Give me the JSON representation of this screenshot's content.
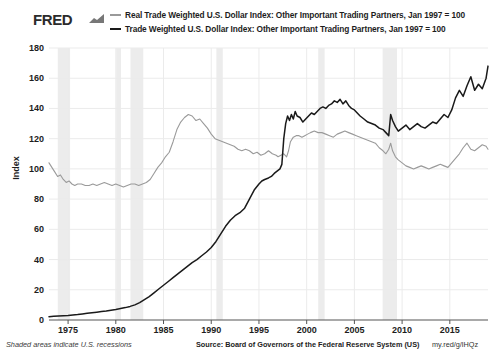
{
  "header": {
    "brand": "FRED",
    "brand_mark_icon": "fred-sparkline-icon"
  },
  "legend": {
    "position": "top",
    "items": [
      {
        "label": "Real Trade Weighted U.S. Dollar Index: Other Important Trading Partners, Jan 1997 = 100",
        "color": "#9a9a9a"
      },
      {
        "label": "Trade Weighted U.S. Dollar Index: Other Important Trading Partners, Jan 1997 = 100",
        "color": "#1a1a1a"
      }
    ]
  },
  "footer": {
    "note": "Shaded areas indicate U.S. recessions",
    "source": "Source: Board of Governors of the Federal Reserve System (US)",
    "url": "my.red/g/lHQz"
  },
  "chart_data": {
    "type": "line",
    "title": "",
    "xlabel": "",
    "ylabel": "Index",
    "xlim": [
      1973.0,
      2019.0
    ],
    "ylim": [
      0,
      180
    ],
    "yticks": [
      0,
      20,
      40,
      60,
      80,
      100,
      120,
      140,
      160,
      180
    ],
    "xticks": [
      1975,
      1980,
      1985,
      1990,
      1995,
      2000,
      2005,
      2010,
      2015
    ],
    "grid": true,
    "grid_color": "#ebebeb",
    "recession_color": "#ececec",
    "recessions": [
      {
        "start": 1973.92,
        "end": 1975.21
      },
      {
        "start": 1980.04,
        "end": 1980.54
      },
      {
        "start": 1981.54,
        "end": 1982.88
      },
      {
        "start": 1990.54,
        "end": 1991.21
      },
      {
        "start": 2001.21,
        "end": 2001.88
      },
      {
        "start": 2007.96,
        "end": 2009.46
      }
    ],
    "series": [
      {
        "name": "Real Trade Weighted U.S. Dollar Index: Other Important Trading Partners, Jan 1997 = 100",
        "color": "#9a9a9a",
        "width": 1.1,
        "x": [
          1973.0,
          1973.3,
          1973.6,
          1973.9,
          1974.2,
          1974.5,
          1974.8,
          1975.1,
          1975.4,
          1975.7,
          1976.0,
          1976.4,
          1976.8,
          1977.2,
          1977.6,
          1978.0,
          1978.4,
          1978.8,
          1979.2,
          1979.6,
          1980.0,
          1980.4,
          1980.8,
          1981.2,
          1981.6,
          1982.0,
          1982.4,
          1982.8,
          1983.2,
          1983.6,
          1984.0,
          1984.4,
          1984.8,
          1985.2,
          1985.6,
          1986.0,
          1986.4,
          1986.8,
          1987.2,
          1987.6,
          1988.0,
          1988.4,
          1988.8,
          1989.2,
          1989.6,
          1990.0,
          1990.4,
          1990.8,
          1991.2,
          1991.6,
          1992.0,
          1992.4,
          1992.8,
          1993.2,
          1993.6,
          1994.0,
          1994.4,
          1994.8,
          1995.2,
          1995.6,
          1996.0,
          1996.4,
          1996.8,
          1997.0,
          1997.3,
          1997.6,
          1997.9,
          1998.1,
          1998.3,
          1998.6,
          1998.9,
          1999.2,
          1999.5,
          1999.8,
          2000.1,
          2000.4,
          2000.8,
          2001.2,
          2001.6,
          2002.0,
          2002.4,
          2002.8,
          2003.2,
          2003.6,
          2004.0,
          2004.4,
          2004.8,
          2005.2,
          2005.6,
          2006.0,
          2006.4,
          2006.8,
          2007.2,
          2007.6,
          2008.0,
          2008.3,
          2008.6,
          2008.8,
          2009.0,
          2009.3,
          2009.6,
          2010.0,
          2010.4,
          2010.8,
          2011.2,
          2011.6,
          2012.0,
          2012.4,
          2012.8,
          2013.2,
          2013.6,
          2014.0,
          2014.4,
          2014.8,
          2015.2,
          2015.6,
          2016.0,
          2016.4,
          2016.8,
          2017.2,
          2017.6,
          2018.0,
          2018.4,
          2018.8,
          2019.0
        ],
        "y": [
          104,
          101,
          98,
          95,
          96,
          93,
          91,
          92,
          90,
          89,
          90,
          90,
          89,
          89,
          90,
          89,
          90,
          91,
          90,
          89,
          90,
          89,
          88,
          89,
          90,
          90,
          89,
          90,
          91,
          93,
          97,
          101,
          104,
          108,
          111,
          118,
          126,
          131,
          134,
          136,
          135,
          132,
          133,
          130,
          127,
          123,
          120,
          119,
          118,
          117,
          116,
          115,
          113,
          112,
          113,
          112,
          110,
          111,
          109,
          110,
          112,
          110,
          109,
          108,
          109,
          110,
          108,
          112,
          118,
          121,
          122,
          122,
          121,
          122,
          123,
          124,
          125,
          124,
          124,
          123,
          122,
          121,
          123,
          124,
          125,
          124,
          123,
          122,
          121,
          120,
          119,
          118,
          117,
          114,
          112,
          110,
          113,
          117,
          112,
          108,
          106,
          104,
          102,
          101,
          100,
          101,
          102,
          101,
          100,
          101,
          102,
          103,
          102,
          101,
          104,
          107,
          110,
          114,
          117,
          113,
          112,
          114,
          116,
          115,
          113
        ]
      },
      {
        "name": "Trade Weighted U.S. Dollar Index: Other Important Trading Partners, Jan 1997 = 100",
        "color": "#1a1a1a",
        "width": 1.5,
        "x": [
          1973.0,
          1973.5,
          1974.0,
          1974.5,
          1975.0,
          1975.5,
          1976.0,
          1976.5,
          1977.0,
          1977.5,
          1978.0,
          1978.5,
          1979.0,
          1979.5,
          1980.0,
          1980.5,
          1981.0,
          1981.5,
          1982.0,
          1982.5,
          1983.0,
          1983.5,
          1984.0,
          1984.5,
          1985.0,
          1985.5,
          1986.0,
          1986.5,
          1987.0,
          1987.5,
          1988.0,
          1988.5,
          1989.0,
          1989.5,
          1990.0,
          1990.5,
          1991.0,
          1991.5,
          1992.0,
          1992.5,
          1993.0,
          1993.5,
          1994.0,
          1994.5,
          1995.0,
          1995.3,
          1995.6,
          1996.0,
          1996.3,
          1996.6,
          1997.0,
          1997.2,
          1997.4,
          1997.6,
          1997.8,
          1998.0,
          1998.2,
          1998.4,
          1998.6,
          1998.8,
          1999.0,
          1999.3,
          1999.6,
          1999.9,
          2000.2,
          2000.5,
          2000.8,
          2001.1,
          2001.4,
          2001.7,
          2002.0,
          2002.3,
          2002.6,
          2002.9,
          2003.2,
          2003.5,
          2003.8,
          2004.1,
          2004.4,
          2004.7,
          2005.0,
          2005.3,
          2005.6,
          2006.0,
          2006.4,
          2006.8,
          2007.2,
          2007.6,
          2008.0,
          2008.3,
          2008.6,
          2008.8,
          2009.0,
          2009.3,
          2009.6,
          2010.0,
          2010.4,
          2010.8,
          2011.2,
          2011.6,
          2012.0,
          2012.4,
          2012.8,
          2013.2,
          2013.6,
          2014.0,
          2014.4,
          2014.8,
          2015.2,
          2015.6,
          2016.0,
          2016.4,
          2016.8,
          2017.2,
          2017.6,
          2018.0,
          2018.4,
          2018.8,
          2019.0
        ],
        "y": [
          2.2,
          2.4,
          2.6,
          2.8,
          3.0,
          3.3,
          3.6,
          4.0,
          4.4,
          4.8,
          5.2,
          5.6,
          6.0,
          6.5,
          7.0,
          7.6,
          8.2,
          9.0,
          10.0,
          11.5,
          13.5,
          15.5,
          18.0,
          20.5,
          23.0,
          25.5,
          28.0,
          30.5,
          33.0,
          35.5,
          38.0,
          40.0,
          42.5,
          45.0,
          48.0,
          52.0,
          57.0,
          62.0,
          66.0,
          69.0,
          71.0,
          74.0,
          80.0,
          86.0,
          90.0,
          92.0,
          93.0,
          94.0,
          95.0,
          97.0,
          99.0,
          100.0,
          103.0,
          120.0,
          130.0,
          135.0,
          132.0,
          136.0,
          133.0,
          138.0,
          135.0,
          134.0,
          131.0,
          133.0,
          135.0,
          137.0,
          136.0,
          138.0,
          140.0,
          141.0,
          140.0,
          142.0,
          143.0,
          145.0,
          144.0,
          146.0,
          143.0,
          145.0,
          142.0,
          140.0,
          139.0,
          137.0,
          135.0,
          133.0,
          131.0,
          130.0,
          129.0,
          127.0,
          126.0,
          124.0,
          122.0,
          136.0,
          132.0,
          128.0,
          125.0,
          127.0,
          129.0,
          126.0,
          128.0,
          130.0,
          128.0,
          127.0,
          129.0,
          131.0,
          130.0,
          133.0,
          136.0,
          134.0,
          139.0,
          147.0,
          152.0,
          148.0,
          155.0,
          161.0,
          152.0,
          156.0,
          153.0,
          160.0,
          168.0
        ]
      }
    ]
  }
}
